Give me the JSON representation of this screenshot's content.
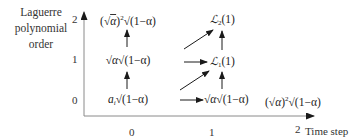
{
  "diagram": {
    "y_axis_label": [
      "Laguerre",
      "polynomial",
      "order"
    ],
    "x_axis_label": "Time step",
    "y_ticks": [
      "2",
      "1",
      "0"
    ],
    "x_ticks": [
      "0",
      "1",
      "2"
    ],
    "nodes": {
      "t0_order2": {
        "pre": "(√",
        "var": "α",
        "mid": ")",
        "sup": "2",
        "sqrt_body": "(1−α)"
      },
      "t0_order1": {
        "pre": "√",
        "var": "α",
        "sqrt_body": "(1−α)"
      },
      "t0_order0": {
        "coef": "a",
        "sub": "i",
        "sqrt_body": "(1−α)"
      },
      "t1_order2": {
        "symbol": "ℒ",
        "sub": "2",
        "arg": "(1)"
      },
      "t1_order1": {
        "symbol": "ℒ",
        "sub": "1",
        "arg": "(1)"
      },
      "t1_order0": {
        "pre": "√",
        "var": "α",
        "sqrt_body": "(1−α)"
      },
      "t2_order0": {
        "pre": "(√",
        "var": "α",
        "mid": ")",
        "sup": "2",
        "sqrt_body": "(1−α)"
      }
    },
    "edges": [
      {
        "from": "t0_order0",
        "to": "t0_order1",
        "type": "vertical"
      },
      {
        "from": "t0_order1",
        "to": "t0_order2",
        "type": "vertical"
      },
      {
        "from": "t0_order0",
        "to": "t1_order0",
        "type": "horizontal"
      },
      {
        "from": "t0_order0",
        "to": "t1_order1",
        "type": "diagonal"
      },
      {
        "from": "t0_order1",
        "to": "t1_order1",
        "type": "horizontal"
      },
      {
        "from": "t0_order1",
        "to": "t1_order2",
        "type": "diagonal"
      },
      {
        "from": "t1_order0",
        "to": "t1_order1",
        "type": "vertical"
      },
      {
        "from": "t1_order1",
        "to": "t1_order2",
        "type": "vertical"
      }
    ],
    "colors": {
      "axis": "#8a8a8a",
      "arrow": "#1a1a1a",
      "text": "#222222"
    }
  }
}
